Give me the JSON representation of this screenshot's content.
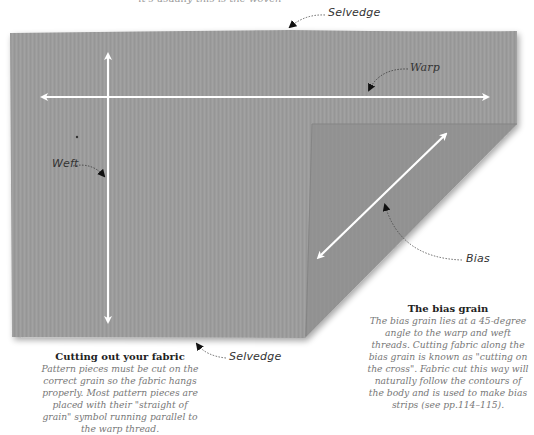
{
  "top_text_cutoff": "it's usually this is the woven",
  "labels": {
    "selvedge_top": "Selvedge",
    "warp": "Warp",
    "weft": "Weft",
    "bias": "Bias",
    "selvedge_bottom": "Selvedge"
  },
  "captions": {
    "cutting": {
      "title": "Cutting out your fabric",
      "body": "Pattern pieces must be cut on the correct grain so the fabric hangs properly. Most pattern pieces are placed with their \"straight of grain\" symbol running parallel to the warp thread."
    },
    "bias": {
      "title": "The bias grain",
      "body": "The bias grain lies at a 45-degree angle to the warp and weft threads. Cutting fabric along the bias grain is known as \"cutting on the cross\". Fabric cut this way will naturally follow the contours of the body and is used to make bias strips (see pp.114–115)."
    }
  },
  "colors": {
    "fabric": "#9b9b9b",
    "fold": "#8e8e8e",
    "arrow": "#ffffff",
    "label": "#333333",
    "caption_body": "#777777"
  }
}
